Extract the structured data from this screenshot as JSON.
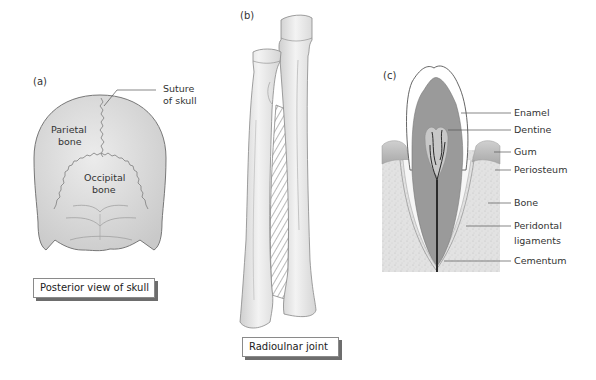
{
  "figure": {
    "panels": [
      {
        "id": "a",
        "tag": "(a)",
        "subject": "skull",
        "labels": {
          "suture_line1": "Suture",
          "suture_line2": "of skull",
          "parietal_line1": "Parietal",
          "parietal_line2": "bone",
          "occipital_line1": "Occipital",
          "occipital_line2": "bone"
        },
        "caption": "Posterior view of skull"
      },
      {
        "id": "b",
        "tag": "(b)",
        "subject": "radius-ulna",
        "caption": "Radioulnar joint"
      },
      {
        "id": "c",
        "tag": "(c)",
        "subject": "tooth",
        "labels": {
          "enamel": "Enamel",
          "dentine": "Dentine",
          "gum": "Gum",
          "periosteum": "Periosteum",
          "bone": "Bone",
          "peridontal_line1": "Peridontal",
          "peridontal_line2": "ligaments",
          "cementum": "Cementum"
        }
      }
    ],
    "colors": {
      "bone_fill": "#d9d9d9",
      "outline": "#777777",
      "dentine": "#9a9a9a",
      "gum": "#bdbdbd",
      "jaw_bone": "#e3e3e3",
      "pulp_nerve": "#2b2b2b"
    }
  }
}
